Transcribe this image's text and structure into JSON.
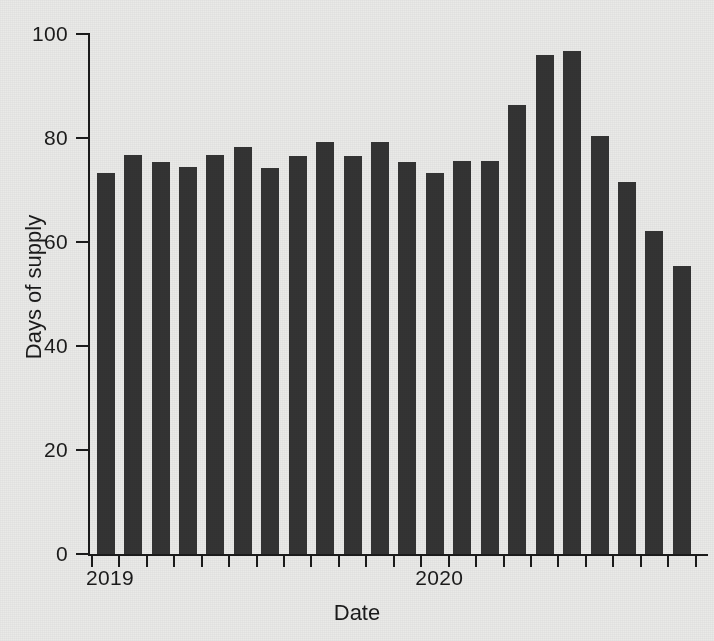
{
  "chart_data": {
    "type": "bar",
    "title": "",
    "subtitle": "",
    "xlabel": "Date",
    "ylabel": "Days of supply",
    "ylim": [
      0,
      100
    ],
    "ytick_labels": [
      "0",
      "20",
      "40",
      "60",
      "80",
      "100"
    ],
    "ytick_values": [
      0,
      20,
      40,
      60,
      80,
      100
    ],
    "xtick_labels": [
      "2019",
      "2020"
    ],
    "xtick_label_positions": [
      0,
      12
    ],
    "grid": false,
    "legend": null,
    "legend_position": "none",
    "n_bars": 22,
    "minor_xticks": true,
    "bar_color": "#343434",
    "background_color": "#eaeae8",
    "axis_color": "#1b1b1b",
    "categories": [
      "2019-Q1a",
      "2019-Q1b",
      "2019-Q2a",
      "2019-Q2b",
      "2019-Q3a",
      "2019-Q3b",
      "2019-Q4a",
      "2019-Q4b",
      "2019-Q4c",
      "2019-Q4d",
      "2019-Q4e",
      "2019-Q4f",
      "2020-Q1a",
      "2020-Q1b",
      "2020-Q1c",
      "2020-Q1d",
      "2020-Q2a",
      "2020-Q2b",
      "2020-Q3a",
      "2020-Q3b",
      "2020-Q4a",
      "2020-Q4b"
    ],
    "values": [
      73.3,
      76.7,
      75.3,
      74.5,
      76.7,
      78.3,
      74.3,
      76.5,
      79.2,
      76.5,
      79.3,
      75.3,
      73.3,
      75.5,
      75.5,
      86.3,
      96.0,
      96.8,
      80.3,
      71.5,
      62.2,
      55.3
    ]
  }
}
